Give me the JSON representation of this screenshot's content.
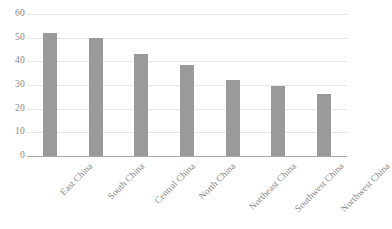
{
  "chart_data": {
    "type": "bar",
    "title": "",
    "subtitle": "",
    "xlabel": "",
    "ylabel": "",
    "categories": [
      "East China",
      "South China",
      "Central China",
      "North China",
      "Northeast China",
      "Southwest China",
      "Northwest China"
    ],
    "values": [
      52,
      50,
      43,
      38.5,
      32,
      29.5,
      26
    ],
    "ylim": [
      0,
      60
    ],
    "yticks": [
      0,
      10,
      20,
      30,
      40,
      50,
      60
    ],
    "ytick_labels": [
      "0",
      "10",
      "20",
      "30",
      "40",
      "50",
      "60"
    ],
    "grid": true,
    "grid_axis": "y",
    "legend": false,
    "legend_position": "none",
    "series": [
      {
        "name": "",
        "color": "#9a9a9a",
        "values": [
          52,
          50,
          43,
          38.5,
          32,
          29.5,
          26
        ]
      }
    ],
    "colors": {
      "bar": "#9a9a9a",
      "gridline": "#e6e6e6",
      "axis": "#a6a6a6",
      "text": "#8a8a8a",
      "background": "#ffffff"
    },
    "x_label_rotation": -45
  }
}
